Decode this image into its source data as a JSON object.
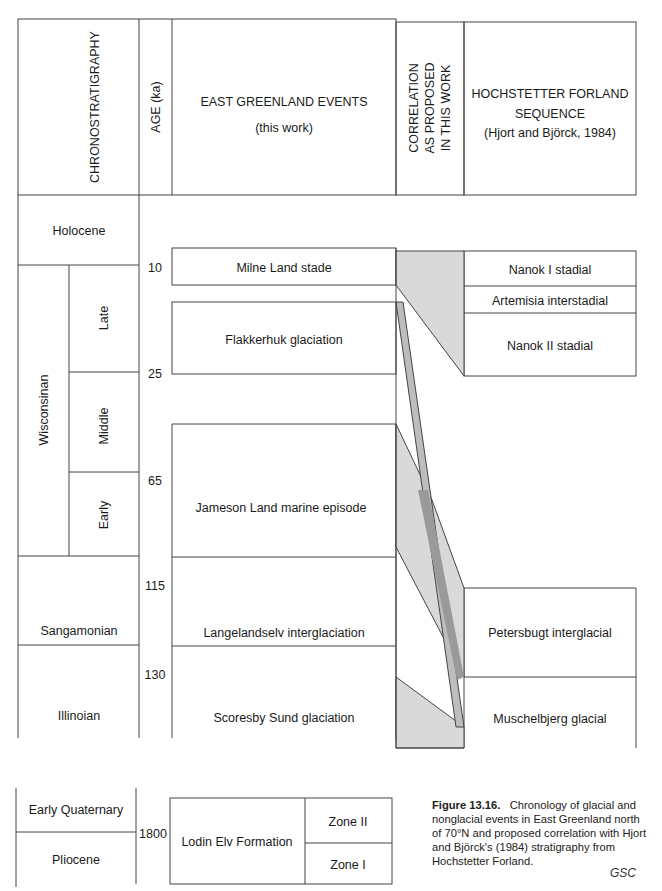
{
  "headers": {
    "chronostratigraphy": "CHRONOSTRATIGRAPHY",
    "age": "AGE (ka)",
    "events_line1": "EAST GREENLAND EVENTS",
    "events_line2": "(this work)",
    "correlation_line1": "CORRELATION",
    "correlation_line2": "AS PROPOSED",
    "correlation_line3": "IN THIS WORK",
    "hochstetter_line1": "HOCHSTETTER FORLAND",
    "hochstetter_line2": "SEQUENCE",
    "hochstetter_line3": "(Hjort and Björck, 1984)"
  },
  "chronostratigraphy": {
    "holocene": "Holocene",
    "wisconsinan": "Wisconsinan",
    "late": "Late",
    "middle": "Middle",
    "early": "Early",
    "sangamonian": "Sangamonian",
    "illinoian": "Illinoian",
    "early_quaternary": "Early Quaternary",
    "pliocene": "Pliocene"
  },
  "ages": {
    "a10": "10",
    "a25": "25",
    "a65": "65",
    "a115": "115",
    "a130": "130",
    "a1800": "1800"
  },
  "events": {
    "milne": "Milne Land stade",
    "flakkerhuk": "Flakkerhuk glaciation",
    "jameson": "Jameson Land marine episode",
    "langelandselv": "Langelandselv interglaciation",
    "scoresby": "Scoresby Sund glaciation",
    "lodin": "Lodin Elv Formation",
    "zone2": "Zone II",
    "zone1": "Zone I"
  },
  "hochstetter": {
    "nanok1": "Nanok I stadial",
    "artemisia": "Artemisia interstadial",
    "nanok2": "Nanok II stadial",
    "petersbugt": "Petersbugt interglacial",
    "muschelbjerg": "Muschelbjerg glacial"
  },
  "colors": {
    "light_shade": "#d9d9d9",
    "mid_shade": "#bdbdbd",
    "dark_shade": "#9a9a9a",
    "line": "#444444"
  },
  "caption": {
    "label": "Figure 13.16.",
    "text": "Chronology of glacial and nonglacial events in East Greenland north of 70°N and proposed correlation with Hjort and Björck's (1984) stratigraphy from Hochstetter Forland.",
    "credit": "GSC"
  }
}
